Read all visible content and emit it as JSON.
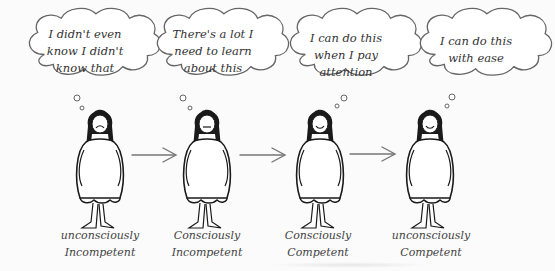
{
  "diagram": {
    "title": "",
    "stages": [
      {
        "thought": [
          "I didn't even",
          "know I didn't",
          "know that"
        ],
        "label": [
          "unconsciously",
          "Incompetent"
        ],
        "mood": "frown"
      },
      {
        "thought": [
          "There's a lot I",
          "need to learn",
          "about this"
        ],
        "label": [
          "Consciously",
          "Incompetent"
        ],
        "mood": "neutral"
      },
      {
        "thought": [
          "I can do this",
          "when I pay",
          "attention"
        ],
        "label": [
          "Consciously",
          "Competent"
        ],
        "mood": "smile"
      },
      {
        "thought": [
          "I can do this",
          "with ease"
        ],
        "label": [
          "unconsciously",
          "Competent"
        ],
        "mood": "smile"
      }
    ],
    "arrows": [
      "arrow-1-to-2",
      "arrow-2-to-3",
      "arrow-3-to-4"
    ],
    "colors": {
      "ink": "#1a1a1a",
      "pencil": "#555555",
      "background": "#fbfbfb"
    }
  }
}
